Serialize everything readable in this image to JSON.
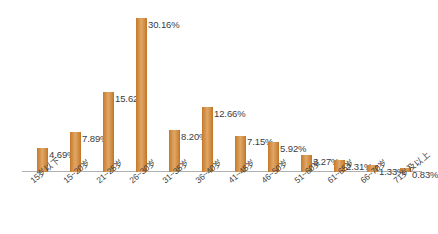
{
  "chart": {
    "title": "",
    "background_color": "#ffffff",
    "bar_color": "#d08b3e",
    "bar_color_light": "#e0a768",
    "bar_color_dark": "#bf7428",
    "axis_color": "#b0b0b0",
    "label_color": "#3c3c3c"
  },
  "chart_data": {
    "type": "bar",
    "title": "",
    "xlabel": "",
    "ylabel": "",
    "ylim": [
      0,
      30.16
    ],
    "grid": false,
    "legend": "none",
    "axis_line": "baseline-only",
    "categories": [
      "15岁以下",
      "15~20岁",
      "21~25岁",
      "26~30岁",
      "31~35岁",
      "36~40岁",
      "41~45岁",
      "46~50岁",
      "51~60岁",
      "61~65岁",
      "66~70岁",
      "71岁及以上"
    ],
    "values": [
      4.69,
      7.89,
      15.62,
      30.16,
      8.2,
      12.66,
      7.15,
      5.92,
      3.27,
      2.31,
      1.33,
      0.83
    ],
    "value_labels": [
      "4.69%",
      "7.89%",
      "15.62%",
      "30.16%",
      "8.20%",
      "12.66%",
      "7.15%",
      "5.92%",
      "3.27%",
      "2.31%",
      "1.33%",
      "0.83%"
    ],
    "value_label_position": "right-of-bar-top"
  }
}
